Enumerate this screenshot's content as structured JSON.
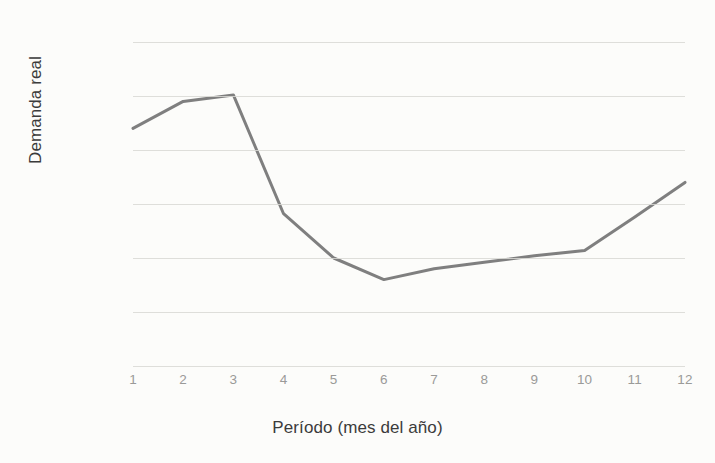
{
  "chart_data": {
    "type": "line",
    "title": "",
    "xlabel": "Período (mes del año)",
    "ylabel": "Demanda real",
    "categories": [
      "1",
      "2",
      "3",
      "4",
      "5",
      "6",
      "7",
      "8",
      "9",
      "10",
      "11",
      "12"
    ],
    "x": [
      1,
      2,
      3,
      4,
      5,
      6,
      7,
      8,
      9,
      10,
      11,
      12
    ],
    "values": [
      220,
      245,
      251,
      141,
      100,
      80,
      90,
      96,
      102,
      107,
      138,
      170
    ],
    "series": [
      {
        "name": "Demanda real",
        "values": [
          220,
          245,
          251,
          141,
          100,
          80,
          90,
          96,
          102,
          107,
          138,
          170
        ],
        "color": "#7f7f7f"
      }
    ],
    "ylim": [
      0,
      300
    ],
    "yticks": [
      0,
      50,
      100,
      150,
      200,
      250,
      300
    ],
    "ytick_labels": [
      "0",
      "50",
      "100",
      "150",
      "200",
      "250",
      "300"
    ],
    "xlim": [
      1,
      12
    ],
    "grid": "horizontal",
    "gridline_color": "#d8d8d4",
    "legend": "none",
    "line_color": "#7f7f7f",
    "line_width": 3,
    "markers": "none",
    "background_color": "#fcfcfa"
  }
}
